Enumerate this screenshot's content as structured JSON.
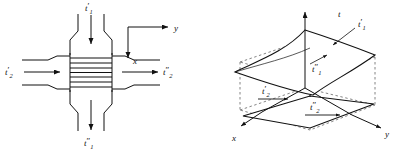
{
  "figure": {
    "background_color": "#ffffff",
    "line_color": "#111111",
    "dashed_color": "#555555",
    "panels": [
      {
        "id": "left",
        "name": "cross-flow-heat-exchanger-schematic",
        "labels": {
          "inlet_top": "t",
          "inlet_top_prime": "′",
          "inlet_top_sub": "1",
          "inlet_left": "t",
          "inlet_left_prime": "′",
          "inlet_left_sub": "2",
          "outlet_right": "t",
          "outlet_right_prime": "″",
          "outlet_right_sub": "2",
          "outlet_bottom": "t",
          "outlet_bottom_prime": "″",
          "outlet_bottom_sub": "1",
          "axis_y": "y",
          "axis_x": "x"
        },
        "core_fin_count": 8
      },
      {
        "id": "right",
        "name": "temperature-surface-3d-diagram",
        "labels": {
          "axis_t": "t",
          "axis_x": "x",
          "axis_y": "y",
          "surface_top_in": "t",
          "surface_top_in_prime": "′",
          "surface_top_in_sub": "1",
          "surface_top_out": "t",
          "surface_top_out_prime": "″",
          "surface_top_out_sub": "1",
          "surface_bottom_in": "t",
          "surface_bottom_in_prime": "′",
          "surface_bottom_in_sub": "2",
          "surface_bottom_out": "t",
          "surface_bottom_out_prime": "″",
          "surface_bottom_out_sub": "2"
        }
      }
    ]
  }
}
